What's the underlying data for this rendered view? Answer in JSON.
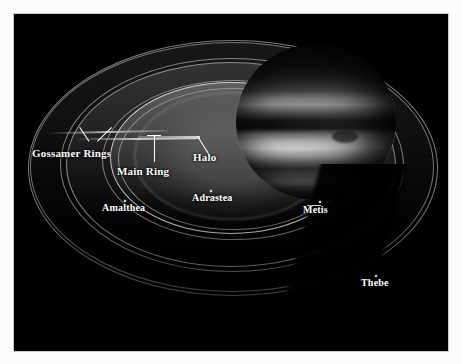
{
  "figure": {
    "background_color": "#000000",
    "frame_color": "#c9c9c9",
    "label_color": "#ffffff"
  },
  "labels": [
    {
      "id": "gossamer-rings",
      "text": "Gossamer Rings",
      "kind": "ring",
      "size": "lg"
    },
    {
      "id": "main-ring",
      "text": "Main Ring",
      "kind": "ring",
      "size": "lg"
    },
    {
      "id": "halo",
      "text": "Halo",
      "kind": "ring",
      "size": "lg"
    },
    {
      "id": "amalthea",
      "text": "Amalthea",
      "kind": "moon",
      "size": "md"
    },
    {
      "id": "adrastea",
      "text": "Adrastea",
      "kind": "moon",
      "size": "md"
    },
    {
      "id": "metis",
      "text": "Metis",
      "kind": "moon",
      "size": "md"
    },
    {
      "id": "thebe",
      "text": "Thebe",
      "kind": "moon",
      "size": "md"
    }
  ],
  "rings": [
    {
      "id": "halo",
      "name": "Halo"
    },
    {
      "id": "main-ring",
      "name": "Main Ring"
    },
    {
      "id": "gossamer-inner",
      "name": "Amalthea Gossamer Ring"
    },
    {
      "id": "gossamer-outer",
      "name": "Thebe Gossamer Ring"
    }
  ],
  "moons": [
    {
      "id": "metis",
      "name": "Metis"
    },
    {
      "id": "adrastea",
      "name": "Adrastea"
    },
    {
      "id": "amalthea",
      "name": "Amalthea"
    },
    {
      "id": "thebe",
      "name": "Thebe"
    }
  ],
  "planet": {
    "name": "Jupiter"
  }
}
